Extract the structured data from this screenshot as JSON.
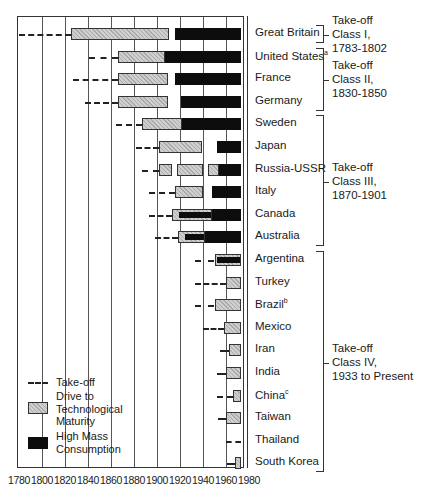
{
  "chart_data": {
    "type": "gantt-timeline",
    "title": "",
    "xlabel": "",
    "ylabel": "",
    "xlim": [
      1780,
      1980
    ],
    "x_ticks": [
      1780,
      1800,
      1820,
      1840,
      1860,
      1880,
      1900,
      1920,
      1940,
      1960,
      1980
    ],
    "grid": "vertical lines every 20 years",
    "legend_position": "bottom-left inside plot",
    "legend": [
      {
        "key": "takeoff",
        "label": "Take-off",
        "style": "dashed line"
      },
      {
        "key": "drive",
        "label": "Drive to Technological Maturity",
        "style": "light stippled bar"
      },
      {
        "key": "mass",
        "label": "High Mass Consumption",
        "style": "solid black bar"
      }
    ],
    "countries": [
      {
        "name": "Great Britain",
        "sup": "",
        "takeoff": [
          1780,
          1825
        ],
        "drive": [
          [
            1825,
            1910
          ]
        ],
        "mass": [
          [
            1916,
            1973
          ]
        ]
      },
      {
        "name": "United States",
        "sup": "a",
        "takeoff": [
          1841,
          1866
        ],
        "drive": [
          [
            1866,
            1907
          ]
        ],
        "mass": [
          [
            1907,
            1973
          ]
        ]
      },
      {
        "name": "France",
        "sup": "",
        "takeoff": [
          1827,
          1866
        ],
        "drive": [
          [
            1866,
            1910
          ]
        ],
        "mass": [
          [
            1916,
            1973
          ]
        ]
      },
      {
        "name": "Germany",
        "sup": "",
        "takeoff": [
          1837,
          1866
        ],
        "drive": [
          [
            1866,
            1910
          ]
        ],
        "mass": [
          [
            1921,
            1973
          ]
        ]
      },
      {
        "name": "Sweden",
        "sup": "",
        "takeoff": [
          1864,
          1887
        ],
        "drive": [
          [
            1887,
            1922
          ]
        ],
        "mass": [
          [
            1922,
            1973
          ]
        ]
      },
      {
        "name": "Japan",
        "sup": "",
        "takeoff": [
          1882,
          1902
        ],
        "drive": [
          [
            1902,
            1939
          ]
        ],
        "mass": [
          [
            1952,
            1973
          ]
        ]
      },
      {
        "name": "Russia-USSR",
        "sup": "",
        "takeoff": [
          1887,
          1902
        ],
        "drive": [
          [
            1902,
            1913
          ],
          [
            1917,
            1940
          ],
          [
            1944,
            1954
          ]
        ],
        "mass": [
          [
            1954,
            1973
          ]
        ]
      },
      {
        "name": "Italy",
        "sup": "",
        "takeoff": [
          1893,
          1916
        ],
        "drive": [
          [
            1916,
            1940
          ]
        ],
        "mass": [
          [
            1948,
            1973
          ]
        ]
      },
      {
        "name": "Canada",
        "sup": "",
        "takeoff": [
          1893,
          1913
        ],
        "drive": [
          [
            1913,
            1948
          ]
        ],
        "mass": [
          [
            1917,
            1973
          ]
        ]
      },
      {
        "name": "Australia",
        "sup": "",
        "takeoff": [
          1898,
          1918
        ],
        "drive": [
          [
            1918,
            1942
          ]
        ],
        "mass": [
          [
            1923,
            1973
          ]
        ]
      },
      {
        "name": "Argentina",
        "sup": "",
        "takeoff": [
          1933,
          1950
        ],
        "drive": [
          [
            1950,
            1973
          ]
        ],
        "mass": [
          [
            1950,
            1973
          ]
        ]
      },
      {
        "name": "Turkey",
        "sup": "",
        "takeoff": [
          1933,
          1960
        ],
        "drive": [
          [
            1960,
            1973
          ]
        ],
        "mass": []
      },
      {
        "name": "Brazil",
        "sup": "b",
        "takeoff": [
          1933,
          1950
        ],
        "drive": [
          [
            1950,
            1973
          ]
        ],
        "mass": []
      },
      {
        "name": "Mexico",
        "sup": "",
        "takeoff": [
          1940,
          1958
        ],
        "drive": [
          [
            1958,
            1973
          ]
        ],
        "mass": []
      },
      {
        "name": "Iran",
        "sup": "",
        "takeoff": [
          1955,
          1963
        ],
        "drive": [
          [
            1963,
            1973
          ]
        ],
        "mass": []
      },
      {
        "name": "India",
        "sup": "",
        "takeoff": [
          1952,
          1960
        ],
        "drive": [
          [
            1960,
            1973
          ]
        ],
        "mass": []
      },
      {
        "name": "China",
        "sup": "c",
        "takeoff": [
          1952,
          1966
        ],
        "drive": [
          [
            1966,
            1973
          ]
        ],
        "mass": []
      },
      {
        "name": "Taiwan",
        "sup": "",
        "takeoff": [
          1953,
          1960
        ],
        "drive": [
          [
            1960,
            1973
          ]
        ],
        "mass": []
      },
      {
        "name": "Thailand",
        "sup": "",
        "takeoff": [
          1960,
          1973
        ],
        "drive": [],
        "mass": []
      },
      {
        "name": "South Korea",
        "sup": "",
        "takeoff": [
          1961,
          1968
        ],
        "drive": [
          [
            1968,
            1973
          ]
        ],
        "mass": []
      }
    ],
    "classes": [
      {
        "lines": [
          "Take-off",
          "Class I,",
          "1783-1802"
        ],
        "countries": [
          "Great Britain"
        ]
      },
      {
        "lines": [
          "Take-off",
          "Class II,",
          "1830-1850"
        ],
        "countries": [
          "United States",
          "France",
          "Germany"
        ]
      },
      {
        "lines": [
          "Take-off",
          "Class III,",
          "1870-1901"
        ],
        "countries": [
          "Sweden",
          "Japan",
          "Russia-USSR",
          "Italy",
          "Canada",
          "Australia"
        ]
      },
      {
        "lines": [
          "Take-off",
          "Class IV,",
          "1933 to Present"
        ],
        "countries": [
          "Argentina",
          "Turkey",
          "Brazil",
          "Mexico",
          "Iran",
          "India",
          "China",
          "Taiwan",
          "Thailand",
          "South Korea"
        ]
      }
    ]
  }
}
